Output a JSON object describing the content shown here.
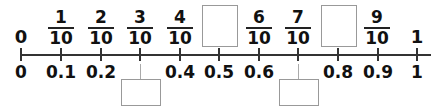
{
  "number_line": {
    "min": 0,
    "max": 1,
    "ticks": [
      0,
      0.1,
      0.2,
      0.3,
      0.4,
      0.5,
      0.6,
      0.7,
      0.8,
      0.9,
      1
    ],
    "top_labels": [
      {
        "type": "whole",
        "text": "0"
      },
      {
        "type": "fraction",
        "num": "1",
        "den": "10"
      },
      {
        "type": "fraction",
        "num": "2",
        "den": "10"
      },
      {
        "type": "fraction",
        "num": "3",
        "den": "10"
      },
      {
        "type": "fraction",
        "num": "4",
        "den": "10"
      },
      {
        "type": "blank_box"
      },
      {
        "type": "fraction",
        "num": "6",
        "den": "10"
      },
      {
        "type": "fraction",
        "num": "7",
        "den": "10"
      },
      {
        "type": "blank_box"
      },
      {
        "type": "fraction",
        "num": "9",
        "den": "10"
      },
      {
        "type": "whole",
        "text": "1"
      }
    ],
    "bottom_labels": [
      "0",
      "0.1",
      "0.2",
      "",
      "0.4",
      "0.5",
      "0.6",
      "",
      "0.8",
      "0.9",
      "1"
    ],
    "bottom_blank_boxes": [
      {
        "points_to": 0.3
      },
      {
        "points_to": 0.7
      }
    ]
  },
  "labels": {
    "w0": "0",
    "w1": "1",
    "f1n": "1",
    "f1d": "10",
    "f2n": "2",
    "f2d": "10",
    "f3n": "3",
    "f3d": "10",
    "f4n": "4",
    "f4d": "10",
    "f6n": "6",
    "f6d": "10",
    "f7n": "7",
    "f7d": "10",
    "f9n": "9",
    "f9d": "10",
    "d0": "0",
    "d1": "0.1",
    "d2": "0.2",
    "d4": "0.4",
    "d5": "0.5",
    "d6": "0.6",
    "d8": "0.8",
    "d9": "0.9",
    "d10": "1"
  }
}
